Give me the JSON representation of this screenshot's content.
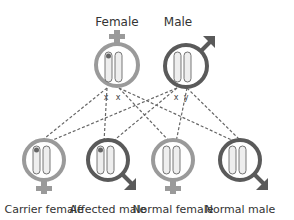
{
  "parents": {
    "female": {
      "label": "Female",
      "alleles": [
        "x",
        "x"
      ],
      "color": "#9a9a9a"
    },
    "male": {
      "label": "Male",
      "alleles": [
        "x",
        "y"
      ],
      "color": "#5a5a5a"
    }
  },
  "offspring": [
    {
      "label": "Carrier female",
      "sex": "female",
      "affected_marker": true
    },
    {
      "label": "Affected male",
      "sex": "male",
      "affected_marker": true
    },
    {
      "label": "Normal female",
      "sex": "female",
      "affected_marker": false
    },
    {
      "label": "Normal male",
      "sex": "male",
      "affected_marker": false
    }
  ],
  "colors": {
    "female": "#9a9a9a",
    "male": "#5a5a5a",
    "line": "#666666",
    "chromosome_fill": "#e8e8e8"
  }
}
